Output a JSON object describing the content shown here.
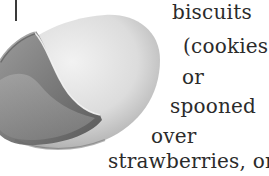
{
  "document": {
    "text_lines": [
      "biscuits",
      "(cookies)",
      "or",
      "spooned",
      "over",
      "strawberries, or"
    ]
  },
  "figure": {
    "colors": {
      "shell_light": "#e6e6e6",
      "shell_mid": "#bdbdbd",
      "shell_inner": "#8a8a8a",
      "shell_dark": "#5e5e5e",
      "text": "#2b2b2b"
    }
  }
}
